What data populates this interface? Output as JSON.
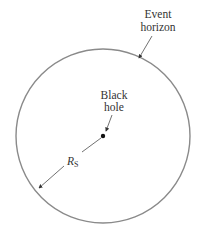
{
  "diagram": {
    "labels": {
      "event_horizon_line1": "Event",
      "event_horizon_line2": "horizon",
      "black_hole_line1": "Black",
      "black_hole_line2": "hole",
      "radius_main": "R",
      "radius_sub": "S"
    },
    "colors": {
      "circle": "#8a8a8a",
      "arrows": "#333333",
      "text": "#333333",
      "dot": "#111111"
    }
  }
}
